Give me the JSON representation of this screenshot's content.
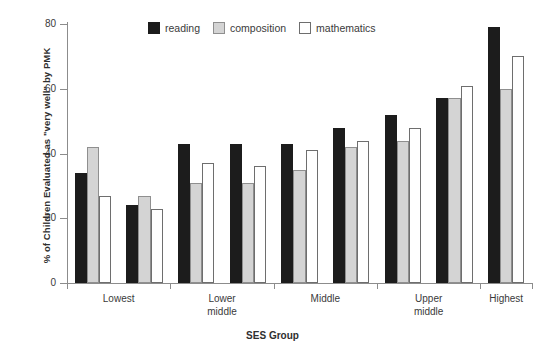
{
  "chart_data": {
    "type": "bar",
    "title": "",
    "xlabel": "SES Group",
    "ylabel": "% of Children Evaluated as \"very well\" by PMK",
    "ylim": [
      0,
      80
    ],
    "yticks": [
      0,
      20,
      40,
      60,
      80
    ],
    "grid": false,
    "legend_position": "top-center",
    "categories": [
      "Lowest",
      "Lowest",
      "Lower middle",
      "Lower middle",
      "Middle",
      "Middle",
      "Upper middle",
      "Upper middle",
      "Highest"
    ],
    "tick_labels": [
      "Lowest",
      "Lower middle",
      "Middle",
      "Upper middle",
      "Highest"
    ],
    "series": [
      {
        "name": "reading",
        "color": "#1c1c1c",
        "values": [
          34,
          24,
          43,
          43,
          43,
          48,
          52,
          57,
          79
        ]
      },
      {
        "name": "composition",
        "color": "#d4d4d4",
        "values": [
          42,
          27,
          31,
          31,
          35,
          42,
          44,
          57,
          60
        ]
      },
      {
        "name": "mathematics",
        "color": "#ffffff",
        "values": [
          27,
          23,
          37,
          36,
          41,
          44,
          48,
          61,
          70
        ]
      }
    ]
  },
  "legend": {
    "items": [
      {
        "label": "reading",
        "swatch": "reading"
      },
      {
        "label": "composition",
        "swatch": "composition"
      },
      {
        "label": "mathematics",
        "swatch": "mathematics"
      }
    ]
  }
}
